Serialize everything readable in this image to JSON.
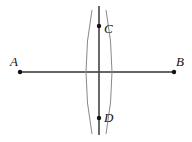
{
  "diagram": {
    "colors": {
      "line": "#333333",
      "arc": "#888888",
      "bisector": "#444444",
      "point": "#111111"
    },
    "points": [
      {
        "id": "A",
        "label": "A",
        "x": 20,
        "y": 72,
        "label_x": 10,
        "label_y": 66
      },
      {
        "id": "B",
        "label": "B",
        "x": 174,
        "y": 72,
        "label_x": 176,
        "label_y": 66
      },
      {
        "id": "C",
        "label": "C",
        "x": 99,
        "y": 26,
        "label_x": 104,
        "label_y": 33
      },
      {
        "id": "D",
        "label": "D",
        "x": 99,
        "y": 118,
        "label_x": 104,
        "label_y": 122
      }
    ],
    "segment_AB": {
      "from": "A",
      "to": "B"
    },
    "bisector_CD": {
      "x": 99,
      "y1": 6,
      "y2": 135
    }
  }
}
